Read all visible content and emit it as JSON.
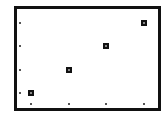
{
  "chart_data": {
    "type": "scatter",
    "title": "",
    "xlabel": "",
    "ylabel": "",
    "x": [
      1,
      2,
      3,
      4
    ],
    "y": [
      1,
      2,
      3,
      4
    ],
    "series": [
      {
        "name": "",
        "x": [
          1,
          2,
          3,
          4
        ],
        "y": [
          1,
          2,
          3,
          4
        ],
        "marker": "square"
      }
    ],
    "xticks": [
      1,
      2,
      3,
      4
    ],
    "yticks": [
      1,
      2,
      3,
      4
    ],
    "xtick_labels": [],
    "ytick_labels": [],
    "grid": false,
    "legend": null,
    "colors": {
      "marker": "#111111",
      "frame": "#111111",
      "background": "#ffffff"
    }
  },
  "layout": {
    "plot": {
      "left": 17,
      "top": 9,
      "width": 141,
      "height": 99
    },
    "x_pixels": [
      31,
      69,
      106,
      144
    ],
    "y_pixels": [
      93,
      70,
      46,
      23
    ],
    "xtick_y": 104,
    "ytick_x": 20
  }
}
